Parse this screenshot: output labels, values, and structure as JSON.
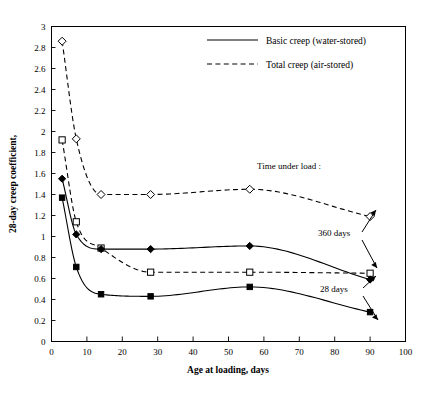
{
  "chart_data": {
    "type": "line",
    "title": "",
    "xlabel": "Age at loading, days",
    "ylabel": "28-day creep coefficient,",
    "xlim": [
      0,
      100
    ],
    "ylim": [
      0,
      3
    ],
    "xticks": [
      0,
      10,
      20,
      30,
      40,
      50,
      60,
      70,
      80,
      90,
      100
    ],
    "yticks": [
      0,
      0.2,
      0.4,
      0.6,
      0.8,
      1,
      1.2,
      1.4,
      1.6,
      1.8,
      2,
      2.2,
      2.4,
      2.6,
      2.8,
      3
    ],
    "xtick_labels": [
      "0",
      "10",
      "20",
      "30",
      "40",
      "50",
      "60",
      "70",
      "80",
      "90",
      "100"
    ],
    "ytick_labels": [
      "0",
      "0.2",
      "0.4",
      "0.6",
      "0.8",
      "1",
      "1.2",
      "1.4",
      "1.6",
      "1.8",
      "2",
      "2.2",
      "2.4",
      "2.6",
      "2.8",
      "3"
    ],
    "grid": false,
    "legend_position": "top-right",
    "legend": [
      {
        "label": "Basic creep (water-stored)",
        "style": "solid"
      },
      {
        "label": "Total creep (air-stored)",
        "style": "dashed"
      }
    ],
    "annotations": [
      {
        "text": "Time under load :",
        "x": 58,
        "y": 1.72
      },
      {
        "text": "360 days",
        "x": 76,
        "y": 1.03
      },
      {
        "text": "28 days",
        "x": 76,
        "y": 0.48
      }
    ],
    "x": [
      3,
      7,
      14,
      28,
      56,
      90
    ],
    "series": [
      {
        "name": "Total creep (air-stored), 360 days",
        "style": "dashed",
        "marker": "open-diamond",
        "values": [
          2.86,
          1.93,
          1.4,
          1.4,
          1.45,
          1.19
        ]
      },
      {
        "name": "Total creep (air-stored), 28 days",
        "style": "dashed",
        "marker": "open-square",
        "values": [
          1.92,
          1.14,
          0.89,
          0.66,
          0.66,
          0.65
        ]
      },
      {
        "name": "Basic creep (water-stored), 360 days",
        "style": "solid",
        "marker": "filled-diamond",
        "values": [
          1.55,
          1.02,
          0.88,
          0.88,
          0.91,
          0.59
        ]
      },
      {
        "name": "Basic creep (water-stored), 28 days",
        "style": "solid",
        "marker": "filled-square",
        "values": [
          1.37,
          0.71,
          0.45,
          0.43,
          0.52,
          0.28
        ]
      }
    ]
  }
}
